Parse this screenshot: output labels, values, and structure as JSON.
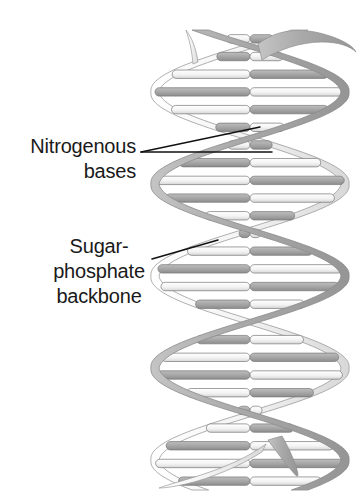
{
  "figure": {
    "background_color": "#ffffff",
    "width": 361,
    "height": 504
  },
  "labels": {
    "nitrogenous_bases": {
      "line1": "Nitrogenous",
      "line2": "bases",
      "align": "right",
      "color": "#1a1a1a"
    },
    "sugar_phosphate_backbone": {
      "line1": "Sugar-",
      "line2": "phosphate",
      "line3": "backbone",
      "align": "center",
      "color": "#1a1a1a"
    }
  },
  "structure": {
    "strand_light_color": "#f2f2f2",
    "strand_light_stroke": "#9a9a9a",
    "strand_dark_color": "#b0b0b0",
    "strand_dark_stroke": "#8a8a8a",
    "rung_light_color": "#f5f5f5",
    "rung_dark_color": "#a6a6a6",
    "rung_stroke": "#777777",
    "leader_line_color": "#111111",
    "turns": 2.5,
    "rung_count": 26,
    "helix_top": 30,
    "helix_bottom": 490,
    "helix_left": 155,
    "helix_right": 345
  },
  "chart_data": {
    "type": "diagram",
    "annotations": [
      {
        "label": "Nitrogenous bases",
        "points_to": "base-pair rungs between the two strands",
        "leader_count": 2,
        "leader_apex": [
          141,
          152
        ],
        "leader_endpoints": [
          [
            260,
            127
          ],
          [
            272,
            152
          ]
        ]
      },
      {
        "label": "Sugar-phosphate backbone",
        "points_to": "helical ribbon strand",
        "leader_count": 1,
        "leader_apex": [
          152,
          259
        ],
        "leader_endpoints": [
          [
            218,
            240
          ]
        ]
      }
    ],
    "components": [
      {
        "name": "sugar-phosphate backbone",
        "count": 2,
        "form": "antiparallel helical ribbon"
      },
      {
        "name": "nitrogenous base pair",
        "count": 26,
        "form": "two-tone horizontal rung"
      }
    ]
  }
}
